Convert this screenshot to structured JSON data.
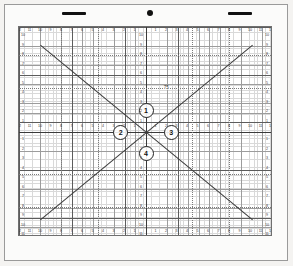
{
  "page": {
    "background_color": "#f4f3f1",
    "sheet_color": "#fbfbfa"
  },
  "topbar": {
    "left_bar_label": "left-alignment-bar",
    "right_bar_label": "right-alignment-bar",
    "center_dot_label": "center-registration-dot"
  },
  "chart_data": {
    "type": "line",
    "title": "",
    "xlabel": "",
    "ylabel": "",
    "xlim": [
      -12,
      12
    ],
    "ylim": [
      -11,
      11
    ],
    "grid": true,
    "grid_minor_step": 1,
    "grid_major_step": 5,
    "grid_fine_step": 0.25,
    "legend": "none",
    "x_ticks": [
      -12,
      -11,
      -10,
      -9,
      -8,
      -7,
      -6,
      -5,
      -4,
      -3,
      -2,
      -1,
      0,
      1,
      2,
      3,
      4,
      5,
      6,
      7,
      8,
      9,
      10,
      11,
      12
    ],
    "x_tick_labels": [
      "12",
      "11",
      "10",
      "9",
      "8",
      "7",
      "6",
      "5",
      "4",
      "3",
      "2",
      "1",
      "",
      "1",
      "2",
      "3",
      "4",
      "5",
      "6",
      "7",
      "8",
      "9",
      "10",
      "11",
      "12"
    ],
    "y_ticks": [
      11,
      10,
      9,
      8,
      7,
      6,
      5,
      4,
      3,
      2,
      1,
      0,
      -1,
      -2,
      -3,
      -4,
      -5,
      -6,
      -7,
      -8,
      -9,
      -10,
      -11
    ],
    "y_tick_labels": [
      "11",
      "10",
      "9",
      "8",
      "7",
      "6",
      "5",
      "4",
      "3",
      "2",
      "1",
      "",
      "1",
      "2",
      "3",
      "4",
      "5",
      "6",
      "7",
      "8",
      "9",
      "10",
      "11"
    ],
    "series": [
      {
        "name": "line-1-ascending",
        "type": "line",
        "points": [
          [
            -12,
            -11
          ],
          [
            12,
            11
          ]
        ],
        "color": "#3b3b3b",
        "slope": 0.9167,
        "intercept": 0
      },
      {
        "name": "line-2-descending",
        "type": "line",
        "points": [
          [
            -12,
            11
          ],
          [
            12,
            -11
          ]
        ],
        "color": "#3b3b3b",
        "slope": -0.9167,
        "intercept": 0
      }
    ],
    "guides": [
      {
        "name": "guide-h-upper",
        "orientation": "horizontal",
        "value": 8,
        "style": "dotted"
      },
      {
        "name": "guide-h-mid-upper",
        "orientation": "horizontal",
        "value": 4.5,
        "style": "dotted"
      },
      {
        "name": "guide-h-mid-lower",
        "orientation": "horizontal",
        "value": -4.5,
        "style": "dotted"
      },
      {
        "name": "guide-h-lower",
        "orientation": "horizontal",
        "value": -8,
        "style": "dotted"
      },
      {
        "name": "guide-v-left",
        "orientation": "vertical",
        "value": -4.5,
        "style": "dotted"
      },
      {
        "name": "guide-v-right",
        "orientation": "vertical",
        "value": 4.5,
        "style": "dotted"
      },
      {
        "name": "guide-v-far-left",
        "orientation": "vertical",
        "value": -8,
        "style": "dotted"
      },
      {
        "name": "guide-v-far-right",
        "orientation": "vertical",
        "value": 8,
        "style": "dotted"
      }
    ],
    "markers": [
      {
        "id": "marker-top",
        "label": "1",
        "x": 0,
        "y": 2.3
      },
      {
        "id": "marker-left",
        "label": "2",
        "x": -2.4,
        "y": 0
      },
      {
        "id": "marker-right",
        "label": "3",
        "x": 2.4,
        "y": 0
      },
      {
        "id": "marker-bottom",
        "label": "4",
        "x": 0,
        "y": -2.3
      }
    ],
    "annotations": [
      {
        "id": "annotation-upper-right",
        "text": "75",
        "x": 1.7,
        "y": 4.8
      }
    ]
  }
}
